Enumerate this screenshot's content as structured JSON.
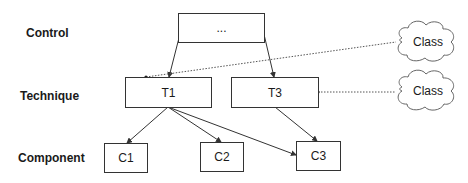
{
  "layers": {
    "control": "Control",
    "technique": "Technique",
    "component": "Component"
  },
  "nodes": {
    "control": "...",
    "t1": "T1",
    "t3": "T3",
    "c1": "C1",
    "c2": "C2",
    "c3": "C3"
  },
  "clouds": {
    "top": "Class",
    "bottom": "Class"
  },
  "colors": {
    "line": "#333333",
    "dotted": "#555555",
    "cloud_stroke": "#666666"
  }
}
